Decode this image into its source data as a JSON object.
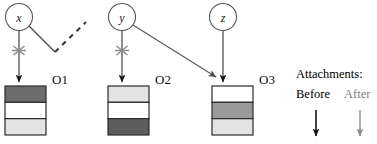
{
  "figure": {
    "nodes": [
      {
        "id": "x",
        "label": "x",
        "cx": 19,
        "cy": 17,
        "r": 13.5
      },
      {
        "id": "y",
        "label": "y",
        "cx": 122,
        "cy": 17,
        "r": 13.5
      },
      {
        "id": "z",
        "label": "z",
        "cx": 223,
        "cy": 17,
        "r": 13.5
      }
    ],
    "objects": [
      {
        "id": "O1",
        "label": "O1",
        "x": 5,
        "y": 86,
        "w": 41,
        "h": 49,
        "bands": [
          {
            "fill": "#6d6d6d"
          },
          {
            "fill": "#ffffff"
          },
          {
            "fill": "#e3e3e3"
          }
        ]
      },
      {
        "id": "O2",
        "label": "O2",
        "x": 108,
        "y": 86,
        "w": 41,
        "h": 49,
        "bands": [
          {
            "fill": "#e3e3e3"
          },
          {
            "fill": "#ffffff"
          },
          {
            "fill": "#5d5d5d"
          }
        ]
      },
      {
        "id": "O3",
        "label": "O3",
        "x": 212,
        "y": 86,
        "w": 41,
        "h": 49,
        "bands": [
          {
            "fill": "#ffffff"
          },
          {
            "fill": "#9a9a9a"
          },
          {
            "fill": "#e3e3e3"
          }
        ]
      }
    ],
    "edges": [
      {
        "id": "x-to-O1",
        "kind": "before-severed",
        "from": "x",
        "to": "O1"
      },
      {
        "id": "x-dangling",
        "kind": "dangling-dashed",
        "from": "x",
        "to": null
      },
      {
        "id": "y-to-O2",
        "kind": "before-severed",
        "from": "y",
        "to": "O2"
      },
      {
        "id": "y-to-O3",
        "kind": "after",
        "from": "y",
        "to": "O3"
      },
      {
        "id": "z-to-O3",
        "kind": "before",
        "from": "z",
        "to": "O3"
      }
    ],
    "legend": {
      "title": "Attachments:",
      "before_label": "Before",
      "after_label": "After",
      "before_color": "#111111",
      "after_color": "#8a8a8a"
    },
    "colors": {
      "stroke": "#3a3a3a",
      "node_stroke": "#555555",
      "box_stroke": "#2b2b2b",
      "sever_marker": "#8e8e8e",
      "after_arrow": "#6e6e6e"
    }
  }
}
